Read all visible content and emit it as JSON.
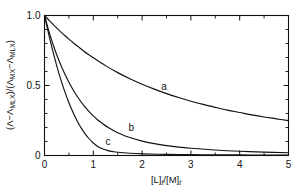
{
  "chart_data": {
    "type": "line",
    "title": "",
    "subtitle": "",
    "xlabel": "[L]t/[M]t",
    "ylabel": "(Λ−ΛMLX)/(ΛMX−ΛMLX)",
    "xlim": [
      0,
      5
    ],
    "ylim": [
      0,
      1.0
    ],
    "grid": false,
    "legend_position": "inline-curve-labels",
    "x_ticks_major": [
      0,
      1,
      2,
      3,
      4,
      5
    ],
    "x_ticks_major_labels": [
      "0",
      "1",
      "2",
      "3",
      "4",
      "5"
    ],
    "x_ticks_minor": [
      0.5,
      1.5,
      2.5,
      3.5,
      4.5
    ],
    "y_ticks_major": [
      0,
      0.5,
      1.0
    ],
    "y_ticks_major_labels": [
      "0",
      "0.5",
      "1.0"
    ],
    "y_ticks_minor": [
      0.1,
      0.2,
      0.3,
      0.4,
      0.6,
      0.7,
      0.8,
      0.9
    ],
    "line_color": "#111111",
    "series": [
      {
        "name": "a",
        "label": "a",
        "label_x": 2.45,
        "label_y": 0.47,
        "x": [
          0,
          0.1,
          0.2,
          0.3,
          0.4,
          0.5,
          0.6,
          0.7,
          0.8,
          0.9,
          1.0,
          1.25,
          1.5,
          1.75,
          2.0,
          2.25,
          2.5,
          2.75,
          3.0,
          3.25,
          3.5,
          3.75,
          4.0,
          4.25,
          4.5,
          4.75,
          5.0
        ],
        "y": [
          1.0,
          0.963,
          0.928,
          0.894,
          0.862,
          0.831,
          0.802,
          0.774,
          0.747,
          0.722,
          0.698,
          0.642,
          0.592,
          0.548,
          0.509,
          0.474,
          0.442,
          0.414,
          0.388,
          0.365,
          0.344,
          0.324,
          0.307,
          0.29,
          0.275,
          0.262,
          0.249
        ]
      },
      {
        "name": "b",
        "label": "b",
        "label_x": 1.78,
        "label_y": 0.175,
        "x": [
          0,
          0.1,
          0.2,
          0.3,
          0.4,
          0.5,
          0.6,
          0.7,
          0.8,
          0.9,
          1.0,
          1.1,
          1.2,
          1.3,
          1.4,
          1.5,
          1.75,
          2.0,
          2.25,
          2.5,
          2.75,
          3.0,
          3.5,
          4.0,
          4.5,
          5.0
        ],
        "y": [
          1.0,
          0.876,
          0.768,
          0.675,
          0.594,
          0.523,
          0.461,
          0.407,
          0.36,
          0.319,
          0.283,
          0.252,
          0.225,
          0.201,
          0.181,
          0.163,
          0.128,
          0.103,
          0.085,
          0.071,
          0.06,
          0.052,
          0.039,
          0.03,
          0.024,
          0.02
        ]
      },
      {
        "name": "c",
        "label": "c",
        "label_x": 1.3,
        "label_y": 0.075,
        "x": [
          0,
          0.1,
          0.2,
          0.3,
          0.4,
          0.5,
          0.6,
          0.7,
          0.8,
          0.9,
          1.0,
          1.1,
          1.2,
          1.3,
          1.4,
          1.5,
          1.75,
          2.0,
          2.5,
          3.0,
          3.5,
          4.0,
          4.5,
          5.0
        ],
        "y": [
          1.0,
          0.845,
          0.706,
          0.581,
          0.472,
          0.377,
          0.296,
          0.227,
          0.171,
          0.125,
          0.089,
          0.063,
          0.046,
          0.035,
          0.028,
          0.023,
          0.016,
          0.012,
          0.008,
          0.006,
          0.005,
          0.004,
          0.003,
          0.003
        ]
      }
    ]
  },
  "axis_title_parts": {
    "x_bracket_l": "[L]",
    "x_sub_t1": "t",
    "x_slash": "/",
    "x_bracket_m": "[M]",
    "x_sub_t2": "t",
    "y_open": "(",
    "y_lambda1": "Λ",
    "y_minus1": "−",
    "y_lambda2": "Λ",
    "y_sub_mlx1": "MLX",
    "y_close_slash": ")/(",
    "y_lambda3": "Λ",
    "y_sub_mx": "MX",
    "y_minus2": "−",
    "y_lambda4": "Λ",
    "y_sub_mlx2": "MLX",
    "y_close": ")"
  }
}
